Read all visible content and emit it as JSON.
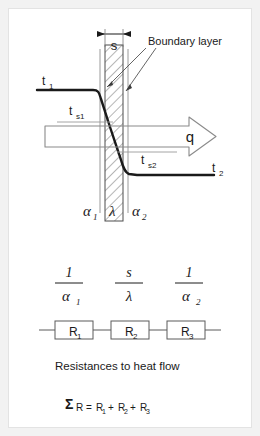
{
  "figure": {
    "title_text": "Resistances to heat flow",
    "sum_equation": "ΣR = R₁ + R₂ + R₃",
    "colors": {
      "frame": "#f2f2f2",
      "background": "#ffffff",
      "curve": "#1a1a1a",
      "thin_line": "#8a8a8a",
      "hatch": "#6e6e6e",
      "text": "#1a1a1a"
    }
  },
  "wall_diagram": {
    "thickness_label": "s",
    "boundary_layer_label": "Boundary layer",
    "heat_flux_label": "q",
    "temperatures": {
      "hot_fluid": "t",
      "hot_fluid_sub": "1",
      "hot_surface": "t",
      "hot_surface_sub": "s1",
      "cold_surface": "t",
      "cold_surface_sub": "s2",
      "cold_fluid": "t",
      "cold_fluid_sub": "2"
    },
    "coefficients": {
      "alpha1": "α",
      "alpha1_sub": "1",
      "lambda": "λ",
      "alpha2": "α",
      "alpha2_sub": "2"
    }
  },
  "fractions": [
    {
      "name": "convection-inside",
      "numerator": "1",
      "denominator": "α",
      "denominator_sub": "1"
    },
    {
      "name": "conduction-wall",
      "numerator": "s",
      "denominator": "λ",
      "denominator_sub": ""
    },
    {
      "name": "convection-outside",
      "numerator": "1",
      "denominator": "α",
      "denominator_sub": "2"
    }
  ],
  "resistors": [
    {
      "label": "R",
      "sub": "1"
    },
    {
      "label": "R",
      "sub": "2"
    },
    {
      "label": "R",
      "sub": "3"
    }
  ],
  "sum_parts": {
    "sigma": "Σ",
    "r_main": "R",
    "equals": "=",
    "r1": "R",
    "r1_sub": "1",
    "plus1": "+",
    "r2": "R",
    "r2_sub": "2",
    "plus2": "+",
    "r3": "R",
    "r3_sub": "3"
  }
}
